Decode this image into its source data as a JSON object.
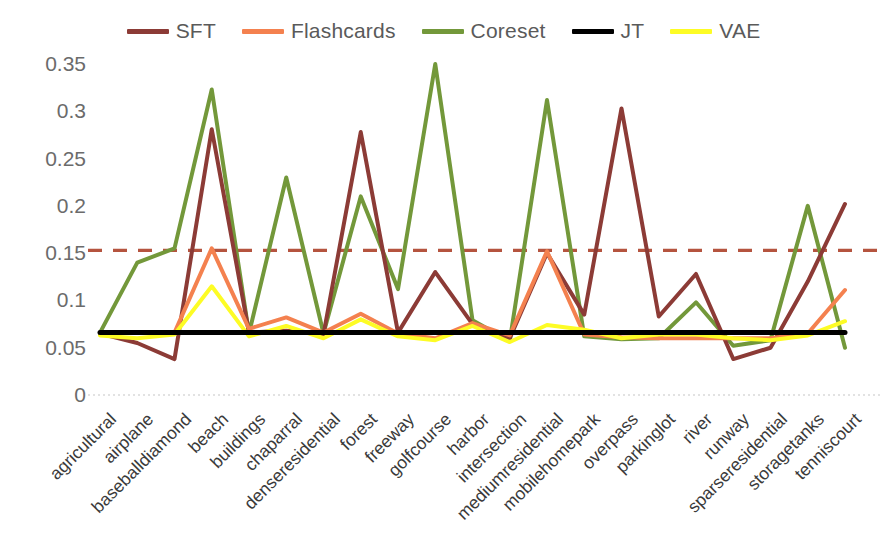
{
  "legend": {
    "position": "top-center",
    "items": [
      {
        "label": "SFT",
        "color": "#8c3b36"
      },
      {
        "label": "Flashcards",
        "color": "#f4814f"
      },
      {
        "label": "Coreset",
        "color": "#73983a"
      },
      {
        "label": "JT",
        "color": "#000000"
      },
      {
        "label": "VAE",
        "color": "#fdfc25"
      }
    ]
  },
  "axis": {
    "y_ticks": [
      "0.35",
      "0.3",
      "0.25",
      "0.2",
      "0.15",
      "0.1",
      "0.05",
      "0"
    ],
    "x_labels": [
      "agricultural",
      "airplane",
      "baseballdiamond",
      "beach",
      "buildings",
      "chaparral",
      "denseresidential",
      "forest",
      "freeway",
      "golfcourse",
      "harbor",
      "intersection",
      "mediumresidential",
      "mobilehomepark",
      "overpass",
      "parkinglot",
      "river",
      "runway",
      "sparseresidential",
      "storagetanks",
      "tenniscourt"
    ]
  },
  "threshold": {
    "value": 0.153,
    "color": "#b5543f",
    "style": "dashed"
  },
  "chart_data": {
    "type": "line",
    "title": "",
    "xlabel": "",
    "ylabel": "",
    "ylim": [
      0,
      0.35
    ],
    "yticks": [
      0,
      0.05,
      0.1,
      0.15,
      0.2,
      0.25,
      0.3,
      0.35
    ],
    "grid": false,
    "legend_position": "top-center",
    "categories": [
      "agricultural",
      "airplane",
      "baseballdiamond",
      "beach",
      "buildings",
      "chaparral",
      "denseresidential",
      "forest",
      "freeway",
      "golfcourse",
      "harbor",
      "intersection",
      "mediumresidential",
      "mobilehomepark",
      "overpass",
      "parkinglot",
      "river",
      "runway",
      "sparseresidential",
      "storagetanks",
      "tenniscourt"
    ],
    "series": [
      {
        "name": "SFT",
        "color": "#8c3b36",
        "values": [
          0.065,
          0.055,
          0.038,
          0.281,
          0.066,
          0.068,
          0.064,
          0.278,
          0.066,
          0.13,
          0.075,
          0.06,
          0.15,
          0.085,
          0.303,
          0.083,
          0.128,
          0.038,
          0.05,
          0.12,
          0.202
        ]
      },
      {
        "name": "Flashcards",
        "color": "#f4814f",
        "values": [
          0.066,
          0.066,
          0.066,
          0.155,
          0.07,
          0.082,
          0.066,
          0.086,
          0.065,
          0.06,
          0.076,
          0.063,
          0.152,
          0.064,
          0.061,
          0.06,
          0.06,
          0.06,
          0.06,
          0.065,
          0.111
        ]
      },
      {
        "name": "Coreset",
        "color": "#73983a",
        "values": [
          0.066,
          0.14,
          0.155,
          0.323,
          0.065,
          0.23,
          0.065,
          0.21,
          0.112,
          0.35,
          0.079,
          0.057,
          0.312,
          0.062,
          0.059,
          0.06,
          0.098,
          0.052,
          0.058,
          0.2,
          0.05
        ]
      },
      {
        "name": "JT",
        "color": "#000000",
        "values": [
          0.066,
          0.066,
          0.066,
          0.066,
          0.066,
          0.066,
          0.066,
          0.066,
          0.066,
          0.066,
          0.066,
          0.066,
          0.066,
          0.066,
          0.066,
          0.066,
          0.066,
          0.066,
          0.066,
          0.066,
          0.066
        ]
      },
      {
        "name": "VAE",
        "color": "#fdfc25",
        "values": [
          0.063,
          0.06,
          0.064,
          0.115,
          0.062,
          0.073,
          0.06,
          0.08,
          0.062,
          0.058,
          0.073,
          0.056,
          0.074,
          0.069,
          0.06,
          0.064,
          0.064,
          0.06,
          0.058,
          0.063,
          0.078
        ]
      }
    ],
    "threshold_line": {
      "value": 0.153,
      "color": "#b5543f",
      "style": "dashed"
    }
  }
}
